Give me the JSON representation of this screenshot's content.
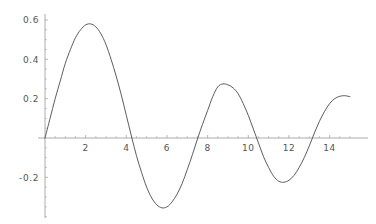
{
  "chart_data": {
    "type": "line",
    "title": "",
    "subtitle": "",
    "xlabel": "",
    "ylabel": "",
    "xlim": [
      -0.35,
      15.4
    ],
    "ylim": [
      -0.42,
      0.63
    ],
    "grid": false,
    "legend": null,
    "x_ticks": [
      2,
      4,
      6,
      8,
      10,
      12,
      14
    ],
    "x_tick_labels": [
      "2",
      "4",
      "6",
      "8",
      "10",
      "12",
      "14"
    ],
    "x_minor_tick_step": 0.5,
    "y_ticks": [
      -0.2,
      0.2,
      0.4,
      0.6
    ],
    "y_tick_labels": [
      "-0.2",
      "0.2",
      "0.4",
      "0.6"
    ],
    "y_minor_tick_step": 0.05,
    "axis_color": "#888888",
    "curve_color": "#4a4a4a",
    "background_color": "#ffffff",
    "series": [
      {
        "name": "damped oscillation",
        "x": [
          0,
          0.25,
          0.5,
          0.75,
          1,
          1.25,
          1.5,
          1.75,
          2,
          2.25,
          2.5,
          2.75,
          3,
          3.25,
          3.5,
          3.75,
          4,
          4.25,
          4.5,
          4.75,
          5,
          5.25,
          5.5,
          5.75,
          6,
          6.25,
          6.5,
          6.75,
          7,
          7.25,
          7.5,
          7.75,
          8,
          8.25,
          8.5,
          8.75,
          9,
          9.25,
          9.5,
          9.75,
          10,
          10.25,
          10.5,
          10.75,
          11,
          11.25,
          11.5,
          11.75,
          12,
          12.25,
          12.5,
          12.75,
          13,
          13.25,
          13.5,
          13.75,
          14,
          14.25,
          14.5,
          14.75,
          15
        ],
        "y": [
          0,
          0.1,
          0.2,
          0.29,
          0.38,
          0.45,
          0.51,
          0.55,
          0.575,
          0.58,
          0.565,
          0.53,
          0.475,
          0.4,
          0.315,
          0.22,
          0.115,
          0.01,
          -0.09,
          -0.175,
          -0.25,
          -0.305,
          -0.34,
          -0.355,
          -0.35,
          -0.325,
          -0.285,
          -0.23,
          -0.16,
          -0.085,
          -0.005,
          0.07,
          0.14,
          0.21,
          0.26,
          0.275,
          0.27,
          0.255,
          0.225,
          0.175,
          0.115,
          0.045,
          -0.025,
          -0.095,
          -0.15,
          -0.195,
          -0.22,
          -0.225,
          -0.215,
          -0.19,
          -0.15,
          -0.1,
          -0.04,
          0.025,
          0.085,
          0.135,
          0.175,
          0.2,
          0.212,
          0.215,
          0.21
        ]
      }
    ],
    "annotations": []
  }
}
